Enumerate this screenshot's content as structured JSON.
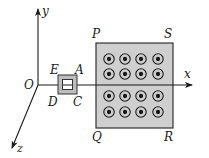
{
  "diagram": {
    "type": "physics-electromagnetic-induction",
    "axes": {
      "origin_label": "O",
      "x_label": "x",
      "y_label": "y",
      "z_label": "z"
    },
    "loop": {
      "shape": "square",
      "corner_labels": {
        "top_left": "E",
        "top_right": "A",
        "bottom_left": "D",
        "bottom_right": "C"
      }
    },
    "field_region": {
      "shape": "rectangle",
      "corner_labels": {
        "top_left": "P",
        "top_right": "S",
        "bottom_left": "Q",
        "bottom_right": "R"
      },
      "field_direction": "out-of-page",
      "symbol": "circle-dot",
      "grid": {
        "rows": 4,
        "cols": 4
      }
    },
    "colors": {
      "line": "#1a1a1a",
      "region_fill": "#cfcfcf",
      "loop_fill": "#bdbdbd",
      "background": "#ffffff"
    }
  }
}
